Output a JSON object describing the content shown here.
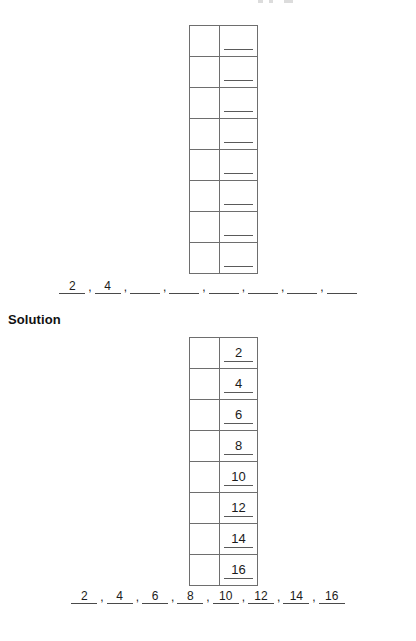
{
  "worksheet": {
    "solution_heading": "Solution",
    "blank_mark": ""
  },
  "exercise_table": {
    "rows": [
      {
        "left": "",
        "right": ""
      },
      {
        "left": "",
        "right": ""
      },
      {
        "left": "",
        "right": ""
      },
      {
        "left": "",
        "right": ""
      },
      {
        "left": "",
        "right": ""
      },
      {
        "left": "",
        "right": ""
      },
      {
        "left": "",
        "right": ""
      },
      {
        "left": "",
        "right": ""
      }
    ]
  },
  "solution_table": {
    "rows": [
      {
        "left": "",
        "right": "2"
      },
      {
        "left": "",
        "right": "4"
      },
      {
        "left": "",
        "right": "6"
      },
      {
        "left": "",
        "right": "8"
      },
      {
        "left": "",
        "right": "10"
      },
      {
        "left": "",
        "right": "12"
      },
      {
        "left": "",
        "right": "14"
      },
      {
        "left": "",
        "right": "16"
      }
    ]
  },
  "sequence_exercise": {
    "separator": ",",
    "terms": [
      "2",
      "4",
      "",
      "",
      "",
      "",
      "",
      ""
    ]
  },
  "sequence_solution": {
    "separator": ",",
    "terms": [
      "2",
      "4",
      "6",
      "8",
      "10",
      "12",
      "14",
      "16"
    ]
  },
  "colors": {
    "text": "#1b1b1b",
    "rule": "#5a5a5a",
    "table_border": "#6e6e6e",
    "page_background": "#ffffff"
  }
}
